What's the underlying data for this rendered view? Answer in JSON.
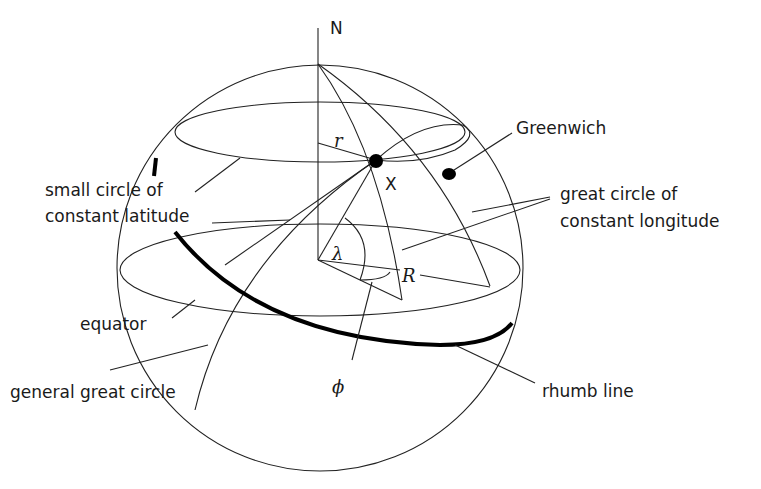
{
  "diagram": {
    "symbols": {
      "north": "N",
      "point_x": "X",
      "small_radius": "r",
      "sphere_radius": "R",
      "longitude_angle": "λ",
      "latitude_angle": "ϕ"
    },
    "labels": {
      "greenwich": "Greenwich",
      "small_circle_line1": "small circle of",
      "small_circle_line2": "constant latitude",
      "great_circle_lon_line1": "great circle of",
      "great_circle_lon_line2": "constant  longitude",
      "equator": "equator",
      "general_great_circle": "general great circle",
      "rhumb_line": "rhumb line"
    }
  }
}
